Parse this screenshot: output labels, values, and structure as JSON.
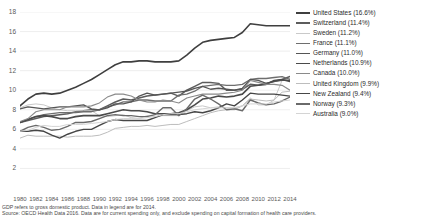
{
  "chart_data": {
    "type": "line",
    "title": "",
    "xlabel": "",
    "ylabel": "",
    "xlim": [
      1980,
      2014
    ],
    "ylim": [
      0,
      18
    ],
    "grid": true,
    "legend_position": "right",
    "x": [
      1980,
      1981,
      1982,
      1983,
      1984,
      1985,
      1986,
      1987,
      1988,
      1989,
      1990,
      1991,
      1992,
      1993,
      1994,
      1995,
      1996,
      1997,
      1998,
      1999,
      2000,
      2001,
      2002,
      2003,
      2004,
      2005,
      2006,
      2007,
      2008,
      2009,
      2010,
      2011,
      2012,
      2013,
      2014
    ],
    "y_ticks": [
      2,
      4,
      6,
      8,
      10,
      12,
      14,
      16,
      18
    ],
    "x_ticks": [
      1980,
      1982,
      1984,
      1986,
      1988,
      1990,
      1992,
      1994,
      1996,
      1998,
      2000,
      2002,
      2004,
      2006,
      2008,
      2010,
      2012,
      2014
    ],
    "series": [
      {
        "name": "United States",
        "label": "United States (16.6%)",
        "value_2014": 16.6,
        "color": "#3f3f3f",
        "width": 1.6,
        "values": [
          8.4,
          9.1,
          9.6,
          9.7,
          9.6,
          9.7,
          10.0,
          10.3,
          10.7,
          11.1,
          11.6,
          12.1,
          12.6,
          12.9,
          12.9,
          13.0,
          13.0,
          12.9,
          12.9,
          12.9,
          13.0,
          13.6,
          14.3,
          14.9,
          15.1,
          15.2,
          15.3,
          15.4,
          15.9,
          16.8,
          16.7,
          16.6,
          16.6,
          16.6,
          16.6
        ]
      },
      {
        "name": "Switzerland",
        "label": "Switzerland (11.4%)",
        "value_2014": 11.4,
        "color": "#5c5c5c",
        "width": 1.5,
        "values": [
          6.7,
          6.9,
          7.1,
          7.3,
          7.4,
          7.5,
          7.6,
          7.8,
          7.9,
          8.0,
          8.0,
          8.4,
          8.8,
          9.1,
          9.0,
          9.2,
          9.4,
          9.5,
          9.6,
          9.7,
          9.4,
          10.0,
          10.4,
          10.8,
          10.8,
          10.7,
          10.0,
          10.0,
          10.1,
          10.6,
          10.5,
          10.7,
          10.9,
          11.1,
          11.4
        ]
      },
      {
        "name": "Sweden",
        "label": "Sweden (11.2%)",
        "value_2014": 11.2,
        "color": "#c9c9c9",
        "width": 1.0,
        "values": [
          8.2,
          8.5,
          8.6,
          8.5,
          8.2,
          8.0,
          7.9,
          7.9,
          7.9,
          7.9,
          7.4,
          7.3,
          7.4,
          7.5,
          7.2,
          7.1,
          7.4,
          7.3,
          7.4,
          7.4,
          7.4,
          7.9,
          8.3,
          8.4,
          8.2,
          8.3,
          8.2,
          8.2,
          8.4,
          9.2,
          8.5,
          8.5,
          9.0,
          11.0,
          11.2
        ]
      },
      {
        "name": "France",
        "label": "France (11.1%)",
        "value_2014": 11.1,
        "color": "#6e6e6e",
        "width": 1.3,
        "values": [
          6.7,
          7.0,
          7.3,
          7.5,
          7.6,
          7.7,
          7.7,
          7.7,
          7.8,
          7.8,
          8.0,
          8.3,
          8.5,
          8.8,
          8.8,
          9.0,
          9.0,
          8.9,
          8.9,
          8.9,
          9.5,
          9.6,
          9.9,
          10.4,
          10.5,
          10.6,
          10.5,
          10.5,
          10.6,
          11.1,
          11.2,
          11.2,
          11.3,
          11.4,
          11.1
        ]
      },
      {
        "name": "Germany",
        "label": "Germany (11.0%)",
        "value_2014": 11.0,
        "color": "#555555",
        "width": 1.3,
        "values": [
          8.1,
          8.3,
          8.2,
          8.1,
          8.2,
          8.3,
          8.3,
          8.4,
          8.5,
          8.1,
          8.0,
          8.2,
          8.6,
          8.6,
          8.8,
          9.4,
          9.7,
          9.5,
          9.6,
          9.7,
          9.8,
          9.9,
          10.2,
          10.4,
          10.1,
          10.2,
          10.1,
          10.0,
          10.2,
          11.1,
          11.0,
          10.7,
          10.9,
          11.0,
          11.0
        ]
      },
      {
        "name": "Netherlands",
        "label": "Netherlands (10.9%)",
        "value_2014": 10.9,
        "color": "#4a4a4a",
        "width": 1.6,
        "values": [
          6.7,
          7.0,
          7.3,
          7.4,
          7.3,
          7.1,
          7.1,
          7.3,
          7.4,
          7.4,
          7.4,
          7.6,
          7.8,
          8.0,
          7.9,
          7.9,
          7.8,
          7.6,
          7.6,
          7.6,
          7.7,
          8.0,
          8.5,
          9.1,
          9.2,
          9.4,
          9.3,
          9.4,
          9.6,
          10.4,
          10.5,
          10.6,
          11.0,
          11.1,
          10.9
        ]
      },
      {
        "name": "Canada",
        "label": "Canada (10.0%)",
        "value_2014": 10.0,
        "color": "#8a8a8a",
        "width": 1.1,
        "values": [
          6.8,
          7.1,
          7.8,
          8.0,
          8.0,
          8.0,
          8.3,
          8.3,
          8.3,
          8.4,
          8.7,
          9.3,
          9.6,
          9.6,
          9.4,
          9.0,
          8.8,
          8.8,
          9.0,
          8.9,
          8.7,
          9.2,
          9.4,
          9.6,
          9.6,
          9.6,
          9.7,
          9.8,
          10.0,
          11.0,
          10.8,
          10.6,
          10.6,
          10.5,
          10.0
        ]
      },
      {
        "name": "United Kingdom",
        "label": "United Kingdom (9.9%)",
        "value_2014": 9.9,
        "color": "#bdbdbd",
        "width": 1.0,
        "values": [
          5.1,
          5.4,
          5.3,
          5.3,
          5.3,
          5.3,
          5.2,
          5.3,
          5.3,
          5.3,
          5.4,
          5.7,
          6.1,
          6.2,
          6.3,
          6.3,
          6.4,
          6.3,
          6.4,
          6.5,
          6.5,
          6.8,
          7.1,
          7.4,
          7.7,
          7.9,
          8.0,
          8.0,
          8.4,
          9.1,
          9.0,
          8.9,
          9.0,
          9.8,
          9.9
        ]
      },
      {
        "name": "New Zealand",
        "label": "New Zealand (9.4%)",
        "value_2014": 9.4,
        "color": "#464646",
        "width": 1.4,
        "values": [
          5.8,
          5.8,
          5.9,
          5.8,
          5.4,
          5.1,
          5.5,
          5.8,
          6.0,
          6.0,
          6.4,
          6.8,
          7.0,
          6.9,
          6.9,
          6.9,
          6.9,
          7.2,
          7.5,
          7.5,
          7.5,
          7.6,
          7.8,
          7.7,
          7.9,
          8.2,
          8.6,
          8.4,
          9.0,
          9.7,
          9.6,
          9.6,
          9.6,
          9.5,
          9.4
        ]
      },
      {
        "name": "Norway",
        "label": "Norway (9.3%)",
        "value_2014": 9.3,
        "color": "#6a6a6a",
        "width": 1.4,
        "values": [
          5.8,
          6.2,
          6.4,
          6.2,
          5.9,
          6.0,
          6.3,
          6.7,
          6.7,
          6.8,
          7.1,
          7.4,
          7.5,
          7.4,
          7.4,
          7.3,
          7.3,
          7.5,
          8.2,
          8.2,
          7.4,
          8.1,
          9.1,
          9.5,
          9.1,
          8.6,
          8.0,
          8.1,
          7.9,
          9.0,
          8.7,
          8.5,
          8.6,
          8.9,
          9.3
        ]
      },
      {
        "name": "Australia",
        "label": "Australia (9.0%)",
        "value_2014": 9.0,
        "color": "#d4d4d4",
        "width": 1.0,
        "values": [
          5.8,
          5.9,
          6.2,
          6.4,
          6.3,
          6.3,
          6.5,
          6.5,
          6.5,
          6.6,
          6.7,
          6.8,
          7.0,
          7.1,
          7.1,
          7.1,
          7.2,
          7.3,
          7.5,
          7.6,
          7.6,
          7.8,
          8.0,
          8.1,
          8.2,
          8.2,
          8.2,
          8.2,
          8.4,
          8.6,
          8.6,
          8.6,
          8.8,
          8.9,
          9.0
        ]
      }
    ]
  },
  "footnotes": [
    "GDP refers to gross domestic product. Data in legend are for 2014.",
    "Source: OECD Health Data 2016. Data are for current spending only, and exclude spending on capital formation of health care providers."
  ],
  "colors": {
    "grid": "#e6e6e6",
    "axis_text": "#5a5a5a",
    "legend_text": "#2b2b2b",
    "footnote_text": "#4a4a4a",
    "background": "#ffffff"
  }
}
